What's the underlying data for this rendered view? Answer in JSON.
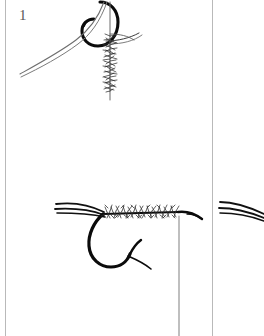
{
  "page": {
    "kind": "scanned-book-page",
    "background_color": "#ffffff",
    "width": 264,
    "height": 336,
    "gutter_color": "#b9b9b9",
    "ink_color": "#111111",
    "dubbing_color": "#3a3a3a",
    "number_color": "#5a5a5a"
  },
  "dividers": [
    {
      "name": "left-gutter-line",
      "x": 5
    },
    {
      "name": "right-gutter-line",
      "x": 212
    }
  ],
  "panels": [
    {
      "id": "panel-1",
      "number": "1",
      "caption": "",
      "elements": [
        "hook-eye-view",
        "thread-vertical",
        "dubbing-noodle",
        "bobbin-thread-trailing"
      ]
    },
    {
      "id": "panel-2",
      "number": "2",
      "caption": "",
      "elements": [
        "hook-side-view",
        "hook-bend",
        "hook-barb",
        "hook-point",
        "hook-eye",
        "tail-fibers",
        "dubbed-body",
        "hanging-thread"
      ]
    },
    {
      "id": "panel-3",
      "number": "3",
      "caption": "",
      "elements": []
    },
    {
      "id": "panel-4",
      "number": "4",
      "caption": "",
      "elements": [
        "tail-fibers"
      ]
    }
  ]
}
